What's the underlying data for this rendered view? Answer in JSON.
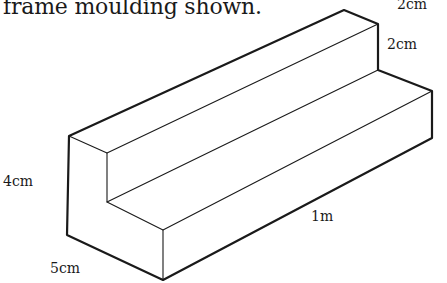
{
  "caption": "frame moulding shown.",
  "labels": {
    "top_width": "2cm",
    "step_height": "2cm",
    "total_height": "4cm",
    "total_width": "5cm",
    "length": "1m"
  },
  "colors": {
    "line": "#1a1a1a",
    "background": "#ffffff"
  }
}
